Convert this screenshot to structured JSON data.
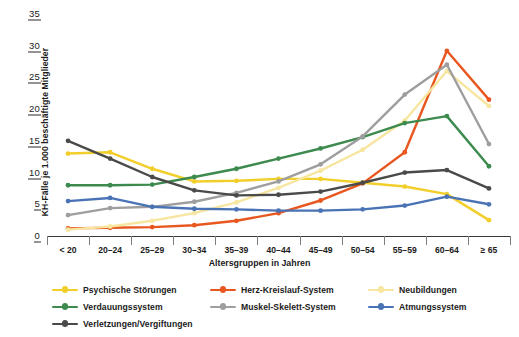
{
  "chart_data": {
    "type": "line",
    "title": "",
    "xlabel": "Altersgruppen in Jahren",
    "ylabel": "KH-Fälle je 1.000 beschäftigte Mitglieder",
    "ylim": [
      0,
      35
    ],
    "yticks": [
      0,
      5,
      10,
      15,
      20,
      25,
      30,
      35
    ],
    "grid": false,
    "legend_position": "bottom",
    "categories": [
      "< 20",
      "20–24",
      "25–29",
      "30–34",
      "35–39",
      "40–44",
      "45–49",
      "50–54",
      "55–59",
      "60–64",
      "≥ 65"
    ],
    "series": [
      {
        "name": "Psychische Störungen",
        "color": "#F2CE2B",
        "values": [
          13.0,
          13.2,
          10.6,
          8.6,
          8.7,
          9.0,
          9.0,
          8.4,
          7.8,
          6.6,
          2.5
        ]
      },
      {
        "name": "Herz-Kreislauf-System",
        "color": "#E8571F",
        "values": [
          1.2,
          1.3,
          1.4,
          1.7,
          2.4,
          3.6,
          5.6,
          8.3,
          13.2,
          29.2,
          21.5
        ]
      },
      {
        "name": "Neubildungen",
        "color": "#F7E6A0",
        "values": [
          1.0,
          1.5,
          2.4,
          3.6,
          5.3,
          7.6,
          10.3,
          13.6,
          18.2,
          26.0,
          20.5
        ]
      },
      {
        "name": "Verdauungssystem",
        "color": "#3D8A4E",
        "values": [
          8.0,
          8.0,
          8.1,
          9.3,
          10.6,
          12.2,
          13.8,
          15.6,
          17.8,
          18.9,
          11.0
        ]
      },
      {
        "name": "Muskel-Skelett-System",
        "color": "#9E9E9E",
        "values": [
          3.3,
          4.4,
          4.6,
          5.4,
          6.8,
          8.6,
          11.3,
          15.7,
          22.3,
          27.0,
          14.5
        ]
      },
      {
        "name": "Atmungssystem",
        "color": "#4A73B5",
        "values": [
          5.5,
          6.0,
          4.6,
          4.3,
          4.2,
          4.0,
          4.0,
          4.2,
          4.8,
          6.2,
          5.0
        ]
      },
      {
        "name": "Verletzungen/Vergiftungen",
        "color": "#4A4A48",
        "values": [
          15.0,
          12.2,
          9.3,
          7.2,
          6.4,
          6.5,
          7.0,
          8.4,
          10.0,
          10.4,
          7.5
        ]
      }
    ]
  },
  "axis": {
    "y_ticks": [
      "0",
      "5",
      "10",
      "15",
      "20",
      "25",
      "30",
      "35"
    ],
    "x_title": "Altersgruppen in Jahren",
    "y_title": "KH-Fälle je 1.000 beschäftigte Mitglieder"
  },
  "legend": {
    "items": [
      {
        "label": "Psychische Störungen",
        "color": "#F2CE2B"
      },
      {
        "label": "Herz-Kreislauf-System",
        "color": "#E8571F"
      },
      {
        "label": "Neubildungen",
        "color": "#F7E6A0"
      },
      {
        "label": "Verdauungssystem",
        "color": "#3D8A4E"
      },
      {
        "label": "Muskel-Skelett-System",
        "color": "#9E9E9E"
      },
      {
        "label": "Atmungssystem",
        "color": "#4A73B5"
      },
      {
        "label": "Verletzungen/Vergiftungen",
        "color": "#4A4A48"
      }
    ]
  }
}
